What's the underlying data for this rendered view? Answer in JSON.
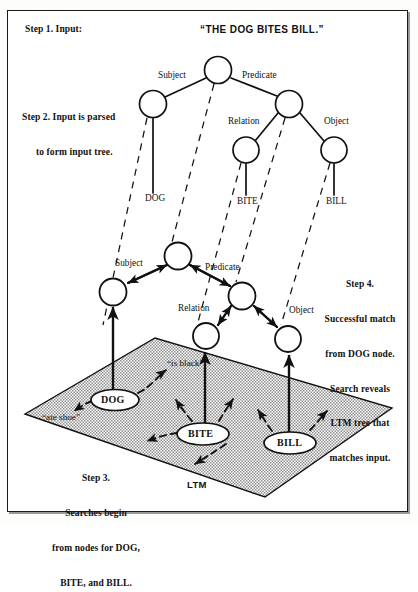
{
  "figure": {
    "title_quote": "“THE DOG BITES BILL.”",
    "steps": {
      "step1": "Step 1. Input:",
      "step2_line1": "Step 2. Input is parsed",
      "step2_line2": "to form input tree.",
      "step3_lines": [
        "Step 3.",
        "Searches begin",
        "from nodes for DOG,",
        "BITE, and BILL."
      ],
      "step4_lines": [
        "Step 4.",
        "Successful match",
        "from DOG node.",
        "Search reveals",
        "LTM tree that",
        "matches input."
      ]
    },
    "input_tree": {
      "edge_labels": {
        "subject": "Subject",
        "predicate": "Predicate",
        "relation": "Relation",
        "object": "Object"
      },
      "terminals": {
        "dog": "DOG",
        "bite": "BITE",
        "bill": "BILL"
      }
    },
    "ltm_tree": {
      "edge_labels": {
        "subject": "Subject",
        "predicate": "Predicate",
        "relation": "Relation",
        "object": "Object"
      }
    },
    "ltm_plane": {
      "label": "LTM",
      "nodes": {
        "dog": "DOG",
        "bite": "BITE",
        "bill": "BILL"
      },
      "associations": {
        "is_black": "“is black”",
        "ate_shoe": "“ate shoe”"
      }
    },
    "colors": {
      "ink": "#111111",
      "frame": "#1a1a1a",
      "plane_fill": "#b9b9b9",
      "paper": "#ffffff"
    }
  }
}
